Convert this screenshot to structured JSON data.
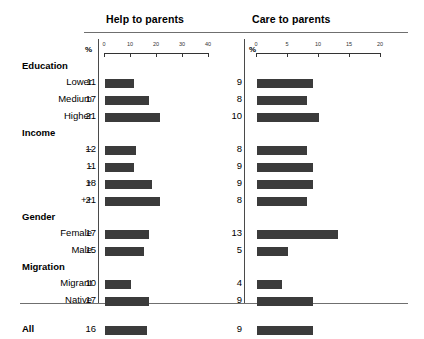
{
  "chart_data": {
    "type": "bar",
    "title": "",
    "orientation": "horizontal",
    "grid": false,
    "legend_position": "none",
    "panels": [
      {
        "key": "help",
        "title": "Help to parents",
        "unit_label": "%",
        "xlabel": "%",
        "xlim": [
          0,
          40
        ],
        "ticks": [
          0,
          10,
          20,
          30,
          40
        ],
        "tick_labels": [
          "0",
          "10",
          "20",
          "30",
          "40"
        ]
      },
      {
        "key": "care",
        "title": "Care to parents",
        "unit_label": "%",
        "xlabel": "%",
        "xlim": [
          0,
          20
        ],
        "ticks": [
          0,
          5,
          10,
          15,
          20
        ],
        "tick_labels": [
          "0",
          "5",
          "10",
          "15",
          "20"
        ]
      }
    ],
    "groups": [
      {
        "label": "Education",
        "rows": [
          {
            "label": "Lower",
            "help": 11,
            "care": 9
          },
          {
            "label": "Medium",
            "help": 17,
            "care": 8
          },
          {
            "label": "Higher",
            "help": 21,
            "care": 10
          }
        ]
      },
      {
        "label": "Income",
        "rows": [
          {
            "label": "--",
            "help": 12,
            "care": 8
          },
          {
            "label": "-",
            "help": 11,
            "care": 9
          },
          {
            "label": "+",
            "help": 18,
            "care": 9
          },
          {
            "label": "++",
            "help": 21,
            "care": 8
          }
        ]
      },
      {
        "label": "Gender",
        "rows": [
          {
            "label": "Female",
            "help": 17,
            "care": 13
          },
          {
            "label": "Male",
            "help": 15,
            "care": 5
          }
        ]
      },
      {
        "label": "Migration",
        "rows": [
          {
            "label": "Migrant",
            "help": 10,
            "care": 4
          },
          {
            "label": "Native",
            "help": 17,
            "care": 9
          }
        ]
      }
    ],
    "total_row": {
      "label": "All",
      "help": 16,
      "care": 9
    },
    "colors": {
      "bar": "#3b3b3b",
      "rule": "#6f6f6f",
      "divider": "#4a4a4a",
      "axis": "#333333",
      "text": "#000000",
      "background": "#ffffff"
    }
  }
}
